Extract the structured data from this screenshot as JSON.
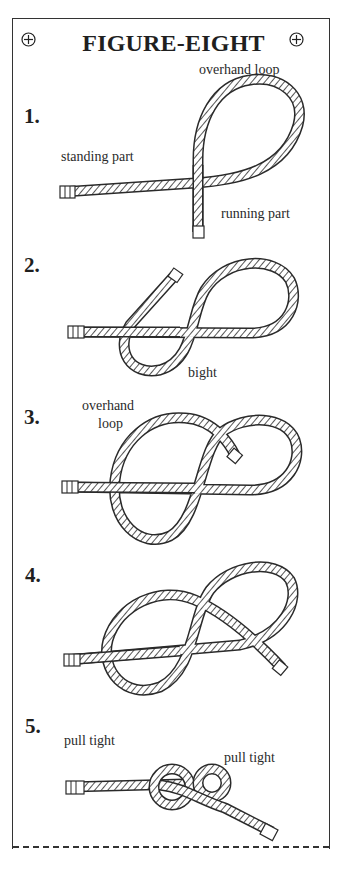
{
  "title": "FIGURE-EIGHT",
  "corner_marks": [
    "crosshair-circle-icon",
    "crosshair-circle-icon"
  ],
  "steps": [
    {
      "number": "1.",
      "labels": [
        "overhand loop",
        "standing part",
        "running part"
      ]
    },
    {
      "number": "2.",
      "labels": [
        "bight"
      ]
    },
    {
      "number": "3.",
      "labels": [
        "overhand",
        "loop"
      ]
    },
    {
      "number": "4.",
      "labels": []
    },
    {
      "number": "5.",
      "labels": [
        "pull tight",
        "pull tight"
      ]
    }
  ],
  "colors": {
    "ink": "#2a2a2a",
    "paper": "#ffffff"
  }
}
